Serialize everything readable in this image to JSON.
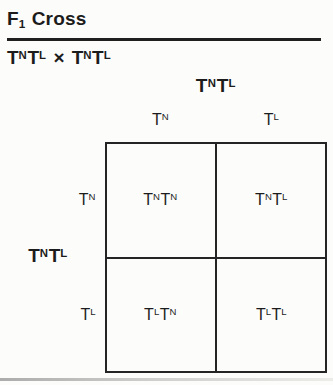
{
  "page": {
    "background": "#fcfcfb",
    "ink": "#1c1c1c",
    "line_color": "#242424"
  },
  "title": {
    "f": "F",
    "sub": "1",
    "rest": "Cross"
  },
  "cross": {
    "left": "T^NT^L",
    "symbol": "×",
    "right": "T^NT^L"
  },
  "punnett": {
    "top_parent": "T^NT^L",
    "left_parent": "T^NT^L",
    "col_headers": [
      "T^N",
      "T^L"
    ],
    "row_headers": [
      "T^N",
      "T^L"
    ],
    "cells": [
      [
        "T^NT^N",
        "T^NT^L"
      ],
      [
        "T^LT^N",
        "T^LT^L"
      ]
    ]
  }
}
